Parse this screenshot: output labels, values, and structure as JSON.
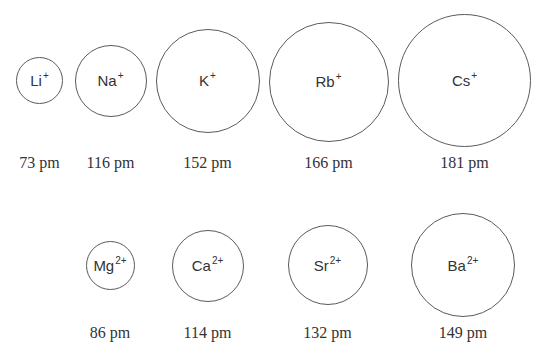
{
  "diagram": {
    "rows": [
      {
        "group": "alkali",
        "ions": [
          {
            "symbol": "Li",
            "charge": "+",
            "radius_label": "73 pm",
            "radius_pm": 73,
            "cx": 39.5,
            "cy": 80.5,
            "r": 23.5
          },
          {
            "symbol": "Na",
            "charge": "+",
            "radius_label": "116 pm",
            "radius_pm": 116,
            "cx": 110.5,
            "cy": 80.5,
            "r": 36
          },
          {
            "symbol": "K",
            "charge": "+",
            "radius_label": "152 pm",
            "radius_pm": 152,
            "cx": 207.5,
            "cy": 80.5,
            "r": 52
          },
          {
            "symbol": "Rb",
            "charge": "+",
            "radius_label": "166 pm",
            "radius_pm": 166,
            "cx": 328.5,
            "cy": 81.5,
            "r": 60
          },
          {
            "symbol": "Cs",
            "charge": "+",
            "radius_label": "181 pm",
            "radius_pm": 181,
            "cx": 464.5,
            "cy": 80,
            "r": 66.5
          }
        ],
        "label_y": 163
      },
      {
        "group": "alkaline-earth",
        "ions": [
          {
            "symbol": "Mg",
            "charge": "2+",
            "radius_label": "86 pm",
            "radius_pm": 86,
            "cx": 110,
            "cy": 265.5,
            "r": 24.5
          },
          {
            "symbol": "Ca",
            "charge": "2+",
            "radius_label": "114 pm",
            "radius_pm": 114,
            "cx": 207.5,
            "cy": 265.5,
            "r": 36
          },
          {
            "symbol": "Sr",
            "charge": "2+",
            "radius_label": "132 pm",
            "radius_pm": 132,
            "cx": 327.5,
            "cy": 265,
            "r": 40
          },
          {
            "symbol": "Ba",
            "charge": "2+",
            "radius_label": "149 pm",
            "radius_pm": 149,
            "cx": 463,
            "cy": 265,
            "r": 52
          }
        ],
        "label_y": 333
      }
    ]
  }
}
